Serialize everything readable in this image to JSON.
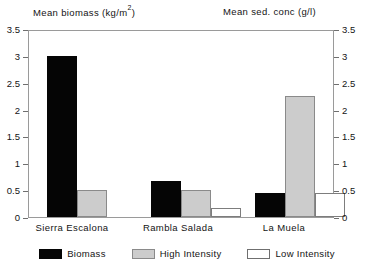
{
  "chart_data": {
    "type": "bar",
    "title": "",
    "left_axis_title": "Mean biomass  (kg/m",
    "left_axis_title_sup": "2",
    "left_axis_title_tail": ")",
    "right_axis_title": "Mean sed. conc  (g/l)",
    "xlabel": "",
    "ylabel": "Mean biomass (kg/m2)",
    "ylabel_right": "Mean sed. conc (g/l)",
    "ylim": [
      0,
      3.5
    ],
    "ylim_right": [
      0,
      3.5
    ],
    "yticks": [
      0,
      0.5,
      1,
      1.5,
      2,
      2.5,
      3,
      3.5
    ],
    "ytick_labels": [
      "0",
      "0.5",
      "1",
      "1.5",
      "2",
      "2.5",
      "3",
      "3.5"
    ],
    "ytick_labels_right": [
      "0",
      "0.5",
      "1",
      "1.5",
      "2",
      "2.5",
      "3",
      "3.5"
    ],
    "grid": false,
    "legend_position": "bottom",
    "categories": [
      "Sierra Escalona",
      "Rambla Salada",
      "La Muela"
    ],
    "series": [
      {
        "name": "Biomass",
        "color": "#050505",
        "values": [
          3.0,
          0.67,
          0.45
        ]
      },
      {
        "name": "High Intensity",
        "color": "#cccccc",
        "values": [
          0.5,
          0.5,
          2.25
        ]
      },
      {
        "name": "Low Intensity",
        "color": "#ffffff",
        "values": [
          null,
          0.17,
          0.45
        ]
      }
    ]
  },
  "titles": {
    "left": "Mean biomass",
    "left_unit_open": "(kg/m",
    "left_unit_sup": "2",
    "left_unit_close": ")",
    "right": "Mean sed. conc  (g/l)"
  },
  "axis": {
    "left_ticks": [
      "3.5",
      "3",
      "2.5",
      "2",
      "1.5",
      "1",
      "0.5",
      "0"
    ],
    "right_ticks": [
      "3.5",
      "3",
      "2.5",
      "2",
      "1.5",
      "1",
      "0.5",
      "0"
    ]
  },
  "categories": [
    {
      "label": "Sierra Escalona"
    },
    {
      "label": "Rambla Salada"
    },
    {
      "label": "La Muela"
    }
  ],
  "legend": [
    {
      "label": "Biomass",
      "swatch": "biomass"
    },
    {
      "label": "High Intensity",
      "swatch": "high"
    },
    {
      "label": "Low Intensity",
      "swatch": "low"
    }
  ]
}
